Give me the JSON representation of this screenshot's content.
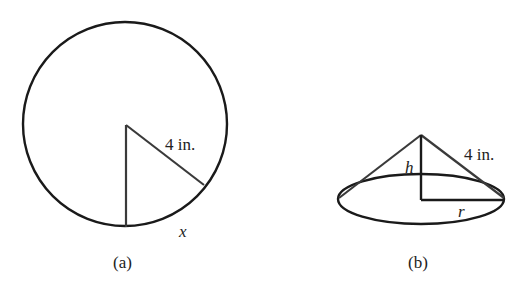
{
  "figure_a": {
    "caption": "(a)",
    "radius_label": "4 in.",
    "arc_label": "x",
    "circle": {
      "cx": 125,
      "cy": 124,
      "r": 102
    },
    "colors": {
      "outline": "#1a1a1a",
      "radius": "#3a3a3a"
    }
  },
  "figure_b": {
    "caption": "(b)",
    "slant_label": "4 in.",
    "height_label": "h",
    "radius_label": "r",
    "cone": {
      "apex": [
        421,
        135
      ],
      "base_cx": 421,
      "base_cy": 199,
      "base_rx": 83,
      "base_ry": 25
    },
    "colors": {
      "outline": "#1a1a1a",
      "slant": "#3a3a3a"
    }
  }
}
